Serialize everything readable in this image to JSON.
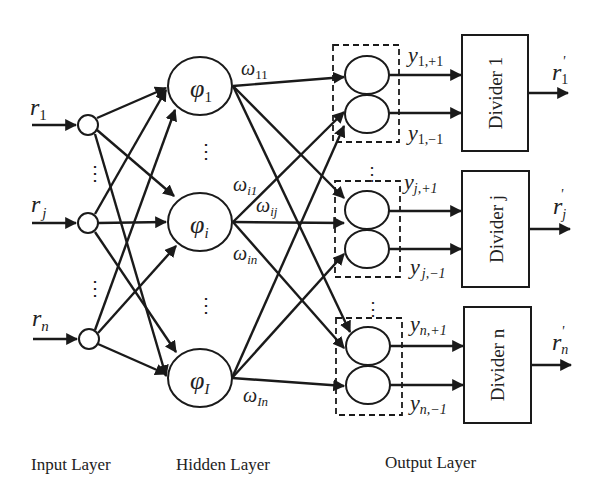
{
  "diagram": {
    "type": "neural-network-architecture",
    "layers": {
      "input": {
        "label": "Input Layer",
        "nodes": [
          {
            "label_main": "r",
            "label_sub": "1"
          },
          {
            "label_main": "r",
            "label_sub": "j"
          },
          {
            "label_main": "r",
            "label_sub": "n"
          }
        ]
      },
      "hidden": {
        "label": "Hidden Layer",
        "nodes": [
          {
            "label_main": "φ",
            "label_sub": "1"
          },
          {
            "label_main": "φ",
            "label_sub": "i"
          },
          {
            "label_main": "φ",
            "label_sub": "I"
          }
        ]
      },
      "output": {
        "label": "Output Layer",
        "groups": [
          {
            "plus_main": "y",
            "plus_sub": "1,+1",
            "minus_main": "y",
            "minus_sub": "1,−1",
            "divider": "Divider 1",
            "out_main": "r",
            "out_sub": "1",
            "out_prime": "'"
          },
          {
            "plus_main": "y",
            "plus_sub": "j,+1",
            "minus_main": "y",
            "minus_sub": "j,−1",
            "divider": "Divider j",
            "out_main": "r",
            "out_sub": "j",
            "out_prime": "'"
          },
          {
            "plus_main": "y",
            "plus_sub": "n,+1",
            "minus_main": "y",
            "minus_sub": "n,−1",
            "divider": "Divider n",
            "out_main": "r",
            "out_sub": "n",
            "out_prime": "'"
          }
        ]
      }
    },
    "weights": [
      {
        "main": "ω",
        "sub": "11"
      },
      {
        "main": "ω",
        "sub": "i1"
      },
      {
        "main": "ω",
        "sub": "ij"
      },
      {
        "main": "ω",
        "sub": "in"
      },
      {
        "main": "ω",
        "sub": "In"
      }
    ],
    "ellipsis": "⋮"
  }
}
